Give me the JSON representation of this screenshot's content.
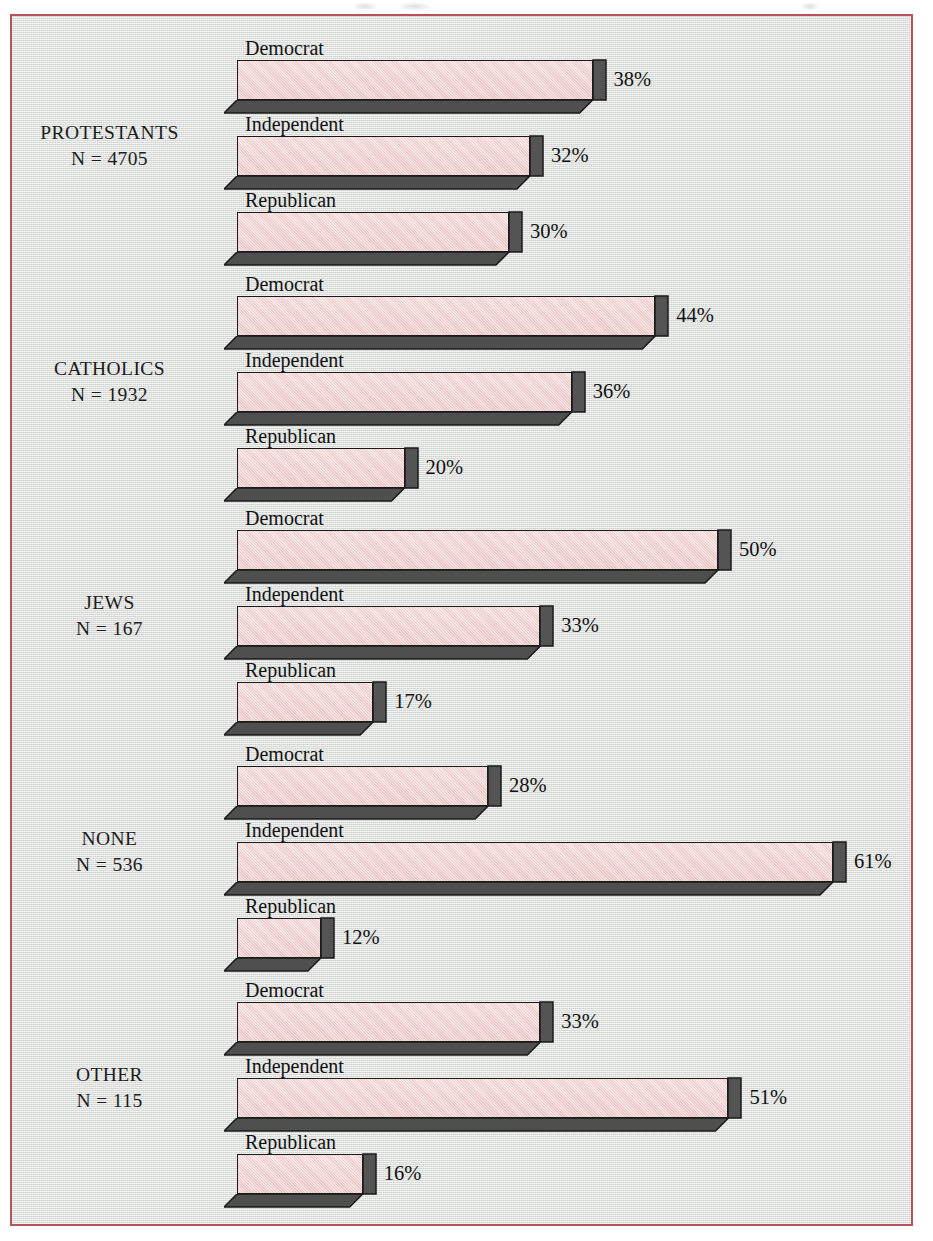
{
  "figure": {
    "background_color": "#dfe2df",
    "border_color": "#b8525a",
    "bar_fill_color": "#f1d3d2",
    "bar_shade_color": "#4a4a4a",
    "bar_outline_color": "#1a1a1a"
  },
  "chart_data": {
    "type": "bar",
    "orientation": "horizontal",
    "title": "",
    "subtitle": "",
    "xlabel": "",
    "ylabel": "",
    "xlim": [
      0,
      61
    ],
    "grid": false,
    "legend_position": "none",
    "value_suffix": "%",
    "categories": [
      "Democrat",
      "Independent",
      "Republican"
    ],
    "groups": [
      {
        "name": "PROTESTANTS",
        "n_label": "N = 4705",
        "n": 4705,
        "bars": [
          {
            "label": "Democrat",
            "value": 38,
            "value_label": "38%"
          },
          {
            "label": "Independent",
            "value": 32,
            "value_label": "32%"
          },
          {
            "label": "Republican",
            "value": 30,
            "value_label": "30%"
          }
        ]
      },
      {
        "name": "CATHOLICS",
        "n_label": "N = 1932",
        "n": 1932,
        "bars": [
          {
            "label": "Democrat",
            "value": 44,
            "value_label": "44%"
          },
          {
            "label": "Independent",
            "value": 36,
            "value_label": "36%"
          },
          {
            "label": "Republican",
            "value": 20,
            "value_label": "20%"
          }
        ]
      },
      {
        "name": "JEWS",
        "n_label": "N = 167",
        "n": 167,
        "bars": [
          {
            "label": "Democrat",
            "value": 50,
            "value_label": "50%"
          },
          {
            "label": "Independent",
            "value": 33,
            "value_label": "33%"
          },
          {
            "label": "Republican",
            "value": 17,
            "value_label": "17%"
          }
        ]
      },
      {
        "name": "NONE",
        "n_label": "N = 536",
        "n": 536,
        "bars": [
          {
            "label": "Democrat",
            "value": 28,
            "value_label": "28%"
          },
          {
            "label": "Independent",
            "value": 61,
            "value_label": "61%"
          },
          {
            "label": "Republican",
            "value": 12,
            "value_label": "12%"
          }
        ]
      },
      {
        "name": "OTHER",
        "n_label": "N = 115",
        "n": 115,
        "bars": [
          {
            "label": "Democrat",
            "value": 33,
            "value_label": "33%"
          },
          {
            "label": "Independent",
            "value": 51,
            "value_label": "51%"
          },
          {
            "label": "Republican",
            "value": 16,
            "value_label": "16%"
          }
        ]
      }
    ]
  }
}
